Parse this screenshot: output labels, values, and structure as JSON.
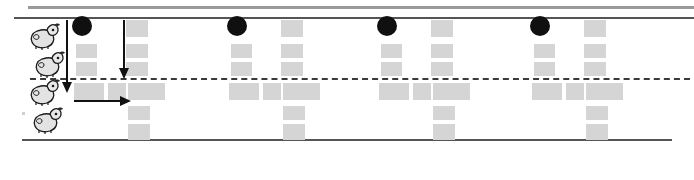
{
  "figure": {
    "width": 694,
    "height": 180,
    "background_color": "#ffffff"
  },
  "colors": {
    "block_gray": "#d5d5d5",
    "notehead_black": "#101010",
    "rule_dark": "#555555",
    "rule_light": "#9a9a9a",
    "arrow_black": "#111111",
    "dashed_line": "#3a3a3a"
  },
  "rules": [
    {
      "name": "top-light-rule",
      "y": 6,
      "x": 28,
      "width": 666,
      "thickness": 3,
      "style": "solid",
      "color": "#9a9a9a"
    },
    {
      "name": "top-dark-rule",
      "y": 17,
      "x": 14,
      "width": 680,
      "thickness": 2,
      "style": "solid",
      "color": "#555555"
    },
    {
      "name": "middle-dashed-rule",
      "y": 78,
      "x": 30,
      "width": 660,
      "thickness": 2,
      "style": "dashed",
      "color": "#3a3a3a"
    },
    {
      "name": "bottom-dark-rule",
      "y": 139,
      "x": 22,
      "width": 650,
      "thickness": 2,
      "style": "solid",
      "color": "#555555"
    }
  ],
  "animals": [
    {
      "label": "animal-figure-1",
      "x": 28,
      "y": 22
    },
    {
      "label": "animal-figure-2",
      "x": 33,
      "y": 50
    },
    {
      "label": "animal-figure-3",
      "x": 28,
      "y": 78
    },
    {
      "label": "animal-figure-4",
      "x": 31,
      "y": 106
    }
  ],
  "noteheads": [
    {
      "label": "notehead-1",
      "x": 72,
      "y": 16
    },
    {
      "label": "notehead-2",
      "x": 227,
      "y": 16
    },
    {
      "label": "notehead-3",
      "x": 377,
      "y": 16
    },
    {
      "label": "notehead-4",
      "x": 530,
      "y": 16
    }
  ],
  "arrows": [
    {
      "label": "down-arrow-left",
      "direction": "down",
      "x": 66,
      "y_start": 20,
      "y_end": 92
    },
    {
      "label": "down-arrow-inner",
      "direction": "down",
      "x": 123,
      "y_start": 20,
      "y_end": 78
    },
    {
      "label": "right-arrow",
      "direction": "right",
      "y": 100,
      "x_start": 74,
      "x_end": 130
    }
  ],
  "block_columns": [
    {
      "name": "unit-1",
      "blocks": [
        {
          "x": 126,
          "y": 20,
          "w": 22,
          "h": 17
        },
        {
          "x": 76,
          "y": 44,
          "w": 21,
          "h": 14
        },
        {
          "x": 126,
          "y": 44,
          "w": 22,
          "h": 14
        },
        {
          "x": 76,
          "y": 62,
          "w": 21,
          "h": 14
        },
        {
          "x": 126,
          "y": 62,
          "w": 22,
          "h": 14
        },
        {
          "x": 74,
          "y": 83,
          "w": 30,
          "h": 17
        },
        {
          "x": 108,
          "y": 83,
          "w": 18,
          "h": 17
        },
        {
          "x": 128,
          "y": 83,
          "w": 37,
          "h": 17
        },
        {
          "x": 128,
          "y": 106,
          "w": 22,
          "h": 14
        },
        {
          "x": 128,
          "y": 124,
          "w": 22,
          "h": 16
        }
      ]
    },
    {
      "name": "unit-2",
      "blocks": [
        {
          "x": 281,
          "y": 20,
          "w": 22,
          "h": 17
        },
        {
          "x": 231,
          "y": 44,
          "w": 21,
          "h": 14
        },
        {
          "x": 281,
          "y": 44,
          "w": 22,
          "h": 14
        },
        {
          "x": 231,
          "y": 62,
          "w": 21,
          "h": 14
        },
        {
          "x": 281,
          "y": 62,
          "w": 22,
          "h": 14
        },
        {
          "x": 229,
          "y": 83,
          "w": 30,
          "h": 17
        },
        {
          "x": 263,
          "y": 83,
          "w": 18,
          "h": 17
        },
        {
          "x": 283,
          "y": 83,
          "w": 37,
          "h": 17
        },
        {
          "x": 283,
          "y": 106,
          "w": 22,
          "h": 14
        },
        {
          "x": 283,
          "y": 124,
          "w": 22,
          "h": 16
        }
      ]
    },
    {
      "name": "unit-3",
      "blocks": [
        {
          "x": 431,
          "y": 20,
          "w": 22,
          "h": 17
        },
        {
          "x": 381,
          "y": 44,
          "w": 21,
          "h": 14
        },
        {
          "x": 431,
          "y": 44,
          "w": 22,
          "h": 14
        },
        {
          "x": 381,
          "y": 62,
          "w": 21,
          "h": 14
        },
        {
          "x": 431,
          "y": 62,
          "w": 22,
          "h": 14
        },
        {
          "x": 379,
          "y": 83,
          "w": 30,
          "h": 17
        },
        {
          "x": 413,
          "y": 83,
          "w": 18,
          "h": 17
        },
        {
          "x": 433,
          "y": 83,
          "w": 37,
          "h": 17
        },
        {
          "x": 433,
          "y": 106,
          "w": 22,
          "h": 14
        },
        {
          "x": 433,
          "y": 124,
          "w": 22,
          "h": 16
        }
      ]
    },
    {
      "name": "unit-4",
      "blocks": [
        {
          "x": 584,
          "y": 20,
          "w": 22,
          "h": 17
        },
        {
          "x": 534,
          "y": 44,
          "w": 21,
          "h": 14
        },
        {
          "x": 584,
          "y": 44,
          "w": 22,
          "h": 14
        },
        {
          "x": 534,
          "y": 62,
          "w": 21,
          "h": 14
        },
        {
          "x": 584,
          "y": 62,
          "w": 22,
          "h": 14
        },
        {
          "x": 532,
          "y": 83,
          "w": 30,
          "h": 17
        },
        {
          "x": 566,
          "y": 83,
          "w": 18,
          "h": 17
        },
        {
          "x": 586,
          "y": 83,
          "w": 37,
          "h": 17
        },
        {
          "x": 586,
          "y": 106,
          "w": 22,
          "h": 14
        },
        {
          "x": 586,
          "y": 124,
          "w": 22,
          "h": 16
        }
      ]
    }
  ],
  "faint_tick": {
    "name": "faint-left-tick",
    "x": 22,
    "y": 112
  }
}
